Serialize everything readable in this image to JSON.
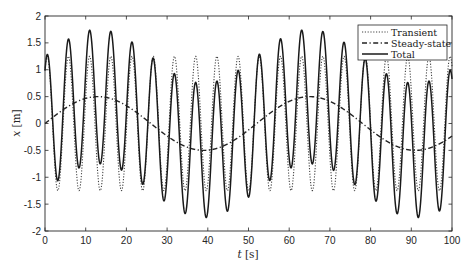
{
  "chart_data": {
    "type": "line",
    "title": "",
    "xlabel": "t [s]",
    "ylabel": "x [m]",
    "xlim": [
      0,
      100
    ],
    "ylim": [
      -2,
      2
    ],
    "xticks": [
      0,
      10,
      20,
      30,
      40,
      50,
      60,
      70,
      80,
      90,
      100
    ],
    "yticks": [
      -2,
      -1.5,
      -1,
      -0.5,
      0,
      0.5,
      1,
      1.5,
      2
    ],
    "xtick_labels": [
      "0",
      "10",
      "20",
      "30",
      "40",
      "50",
      "60",
      "70",
      "80",
      "90",
      "100"
    ],
    "ytick_labels": [
      "-2",
      "-1.5",
      "-1",
      "-0.5",
      "0",
      "0.5",
      "1",
      "1.5",
      "2"
    ],
    "grid": false,
    "legend_position": "upper right",
    "series": [
      {
        "name": "Transient",
        "style": "dotted",
        "model": "1.25*cos(1.206*(t-0.55))",
        "amplitude": 1.25,
        "period_s": 5.21,
        "peak_values_approx": [
          1.25,
          1.25,
          1.25,
          1.25,
          1.25,
          1.25,
          1.25,
          1.25,
          1.25,
          1.25,
          1.25,
          1.25,
          1.25,
          1.25,
          1.25,
          1.25,
          1.25,
          1.25,
          1.25,
          1.25
        ]
      },
      {
        "name": "Steady-state",
        "style": "dash-dot",
        "model": "0.5*sin(0.1208*t)",
        "amplitude": 0.5,
        "period_s": 52,
        "key_points": [
          {
            "t": 0,
            "x": 0
          },
          {
            "t": 13,
            "x": 0.5
          },
          {
            "t": 26,
            "x": 0
          },
          {
            "t": 39,
            "x": -0.5
          },
          {
            "t": 52,
            "x": 0
          },
          {
            "t": 65,
            "x": 0.5
          },
          {
            "t": 78,
            "x": 0
          },
          {
            "t": 91,
            "x": -0.5
          },
          {
            "t": 100,
            "x": -0.4
          }
        ]
      },
      {
        "name": "Total",
        "style": "solid",
        "model": "Transient + Steady-state",
        "peak_points_approx": [
          {
            "t": 0.6,
            "x": 1.3
          },
          {
            "t": 5.8,
            "x": 1.6
          },
          {
            "t": 11.0,
            "x": 1.75
          },
          {
            "t": 16.2,
            "x": 1.72
          },
          {
            "t": 21.4,
            "x": 1.53
          },
          {
            "t": 26.6,
            "x": 1.25
          },
          {
            "t": 31.8,
            "x": 0.95
          },
          {
            "t": 37.0,
            "x": 0.6
          },
          {
            "t": 42.2,
            "x": 0.65
          },
          {
            "t": 47.4,
            "x": 0.95
          },
          {
            "t": 52.6,
            "x": 1.3
          },
          {
            "t": 57.8,
            "x": 1.58
          },
          {
            "t": 63.0,
            "x": 1.8
          },
          {
            "t": 68.2,
            "x": 1.72
          },
          {
            "t": 73.4,
            "x": 1.55
          },
          {
            "t": 78.6,
            "x": 1.25
          },
          {
            "t": 83.8,
            "x": 0.95
          },
          {
            "t": 89.0,
            "x": 0.6
          },
          {
            "t": 94.2,
            "x": 0.65
          },
          {
            "t": 99.4,
            "x": 0.95
          }
        ],
        "min_approx": -1.8
      }
    ]
  },
  "legend": {
    "items": [
      {
        "label": "Transient",
        "style": "dotted"
      },
      {
        "label": "Steady-state",
        "style": "dash-dot"
      },
      {
        "label": "Total",
        "style": "solid"
      }
    ]
  },
  "colors": {
    "axes": "#262626",
    "transient": "#333333",
    "steady_state": "#222222",
    "total": "#1a1a1a",
    "background": "#ffffff"
  }
}
